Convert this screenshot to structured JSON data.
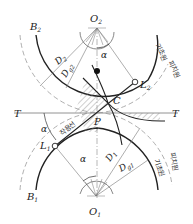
{
  "diagram": {
    "labels": {
      "O1": "O",
      "O1_sub": "1",
      "O2": "O",
      "O2_sub": "2",
      "B1": "B",
      "B1_sub": "1",
      "B2": "B",
      "B2_sub": "2",
      "L1": "L",
      "L1_sub": "1",
      "L2": "L",
      "L2_sub": "2",
      "P": "P",
      "C": "C",
      "T_left": "T",
      "T_right": "T",
      "alpha_top": "α",
      "alpha_left": "α",
      "alpha_bottom": "α",
      "D1": "D",
      "D1_sub": "1",
      "Dg1": "D",
      "Dg1_sub": "g1",
      "D2": "D",
      "D2_sub": "2",
      "Dg2": "D",
      "Dg2_sub": "g2"
    },
    "korean_labels": {
      "line_of_action": "작용선",
      "base_circle_top": "기초원",
      "pitch_circle_top": "피치원",
      "base_circle_bottom": "기초원",
      "pitch_circle_bottom": "피치원"
    },
    "colors": {
      "line": "#222222",
      "dashed": "#999999",
      "hatch": "#888888"
    }
  }
}
